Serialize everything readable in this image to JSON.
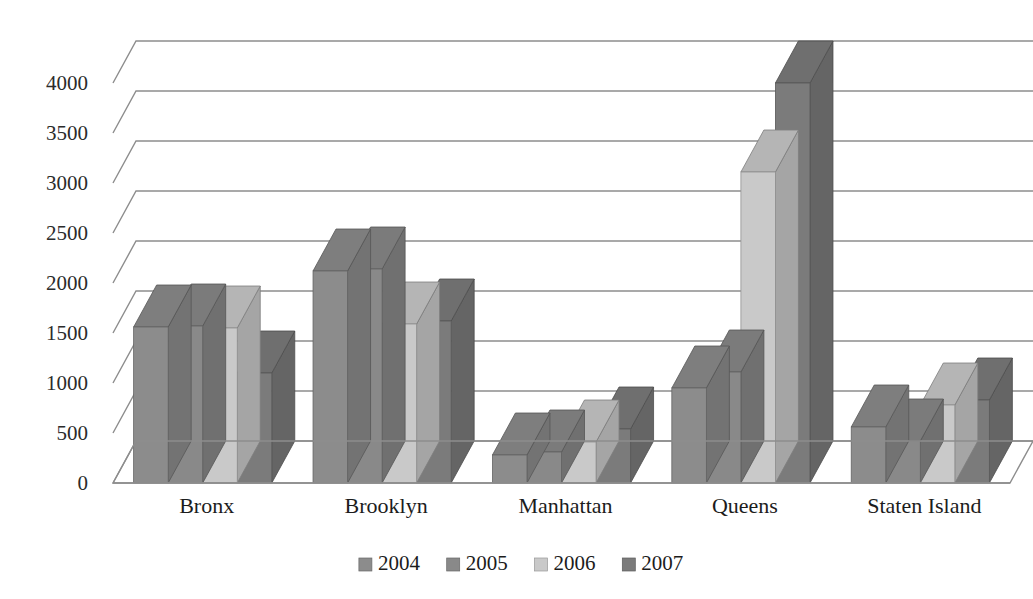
{
  "chart_data": {
    "type": "bar",
    "title": "",
    "xlabel": "",
    "ylabel": "",
    "categories": [
      "Bronx",
      "Brooklyn",
      "Manhattan",
      "Queens",
      "Staten Island"
    ],
    "series": [
      {
        "name": "2004",
        "values": [
          1560,
          2120,
          280,
          950,
          560
        ]
      },
      {
        "name": "2005",
        "values": [
          1570,
          2140,
          310,
          1110,
          420
        ]
      },
      {
        "name": "2006",
        "values": [
          1550,
          1590,
          410,
          3110,
          780
        ]
      },
      {
        "name": "2007",
        "values": [
          1100,
          1620,
          540,
          4000,
          830
        ]
      }
    ],
    "ylim": [
      0,
      4000
    ],
    "ytick_step": 500,
    "yticks": [
      "0",
      "500",
      "1000",
      "1500",
      "2000",
      "2500",
      "3000",
      "3500",
      "4000"
    ],
    "grid": true,
    "legend_position": "bottom",
    "three_d": true
  },
  "colors": {
    "series_2004": "#8c8c8c",
    "series_2005": "#898989",
    "series_2006": "#c9c9c9",
    "series_2007": "#7b7b7b",
    "gridline": "#8d8d8d",
    "text": "#1c1c1c",
    "background": "#ffffff"
  },
  "legend": {
    "items": [
      {
        "label": "2004",
        "color": "#8c8c8c"
      },
      {
        "label": "2005",
        "color": "#898989"
      },
      {
        "label": "2006",
        "color": "#c9c9c9"
      },
      {
        "label": "2007",
        "color": "#7b7b7b"
      }
    ]
  }
}
